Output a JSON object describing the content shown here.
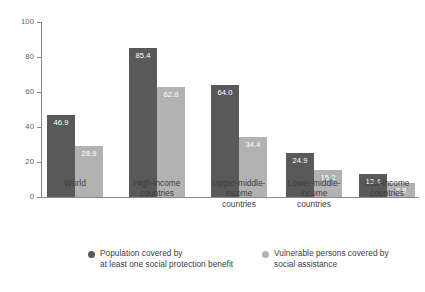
{
  "chart_data": {
    "type": "bar",
    "title": "",
    "subtitle": "",
    "xlabel": "",
    "ylabel": "",
    "ylim": [
      0,
      100
    ],
    "yticks": [
      0,
      20,
      40,
      60,
      80,
      100
    ],
    "ytick_labels": [
      "0",
      "20",
      "40",
      "60",
      "80",
      "100"
    ],
    "grid": false,
    "legend_position": "bottom",
    "categories": [
      "World",
      "High-income\ncountries",
      "Upper-middle-\nincome\ncountries",
      "Lower-middle-\nincome\ncountries",
      "Low-income\ncountries"
    ],
    "series": [
      {
        "name": "Population covered by\nat least one social protection benefit",
        "color": "#595959",
        "values": [
          46.9,
          85.4,
          64.0,
          24.9,
          13.4
        ],
        "labels": [
          "46.9",
          "85.4",
          "64.0",
          "24.9",
          "13.4"
        ]
      },
      {
        "name": "Vulnerable persons covered by\nsocial assistance",
        "color": "#b2b2b2",
        "values": [
          28.9,
          62.8,
          34.4,
          15.2,
          7.8
        ],
        "labels": [
          "28.9",
          "62.8",
          "34.4",
          "15.2",
          "7.8"
        ]
      }
    ]
  },
  "legend": {
    "items": [
      {
        "label": "Population covered by\nat least one social protection benefit",
        "color": "#595959",
        "marker": "circle-marker"
      },
      {
        "label": "Vulnerable persons covered by\nsocial assistance",
        "color": "#b2b2b2",
        "marker": "circle-marker"
      }
    ]
  }
}
